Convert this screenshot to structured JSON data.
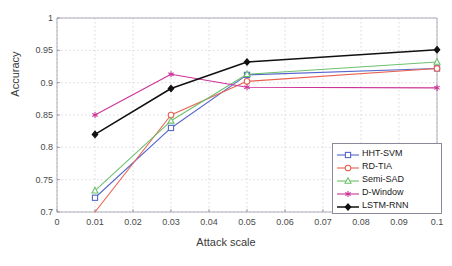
{
  "chart_data": {
    "type": "line",
    "title": "",
    "xlabel": "Attack scale",
    "ylabel": "Accuracy",
    "x": [
      0.01,
      0.03,
      0.05,
      0.1
    ],
    "xlim": [
      0,
      0.1
    ],
    "ylim": [
      0.7,
      1
    ],
    "xticks": [
      0,
      0.01,
      0.02,
      0.03,
      0.04,
      0.05,
      0.06,
      0.07,
      0.08,
      0.09,
      0.1
    ],
    "xtick_labels": [
      "0",
      "0.01",
      "0.02",
      "0.03",
      "0.04",
      "0.05",
      "0.06",
      "0.07",
      "0.08",
      "0.09",
      "0.1"
    ],
    "yticks": [
      0.7,
      0.75,
      0.8,
      0.85,
      0.9,
      0.95,
      1
    ],
    "ytick_labels": [
      "0.7",
      "0.75",
      "0.8",
      "0.85",
      "0.9",
      "0.95",
      "1"
    ],
    "grid": true,
    "legend_position": "lower right",
    "series": [
      {
        "name": "HHT-SVM",
        "color": "#5566cc",
        "marker": "square",
        "values": [
          0.722,
          0.83,
          0.912,
          0.922
        ]
      },
      {
        "name": "RD-TIA",
        "color": "#e8614f",
        "marker": "circle",
        "values": [
          0.7,
          0.85,
          0.902,
          0.922
        ]
      },
      {
        "name": "Semi-SAD",
        "color": "#6ec06e",
        "marker": "triangle",
        "values": [
          0.733,
          0.841,
          0.913,
          0.932
        ]
      },
      {
        "name": "D-Window",
        "color": "#cc3399",
        "marker": "star",
        "values": [
          0.85,
          0.913,
          0.893,
          0.892
        ]
      },
      {
        "name": "LSTM-RNN",
        "color": "#111111",
        "marker": "diamond",
        "values": [
          0.82,
          0.891,
          0.932,
          0.951
        ]
      }
    ]
  }
}
